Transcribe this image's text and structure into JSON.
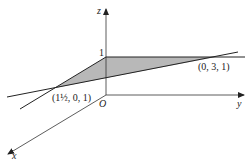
{
  "diagram": {
    "axes": {
      "x_label": "x",
      "y_label": "y",
      "z_label": "z",
      "origin_label": "O"
    },
    "tick_z": "1",
    "points": [
      {
        "label": "(1½, 0, 1)",
        "coords": [
          1.5,
          0,
          1
        ]
      },
      {
        "label": "(0, 3, 1)",
        "coords": [
          0,
          3,
          1
        ]
      }
    ],
    "colors": {
      "line": "#222222",
      "shade": "#b8b8b8",
      "background": "#ffffff"
    }
  }
}
